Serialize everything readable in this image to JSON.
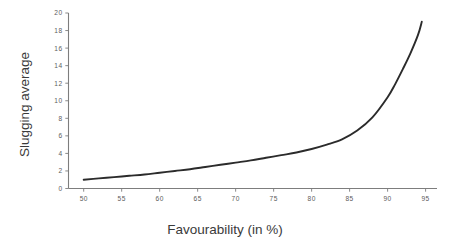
{
  "chart_data": {
    "type": "line",
    "title": "",
    "xlabel": "Favourability (in %)",
    "ylabel": "Slugging average",
    "xlim": [
      48,
      96.5
    ],
    "ylim": [
      0,
      20
    ],
    "grid": false,
    "legend": false,
    "xticks": [
      50,
      55,
      60,
      65,
      70,
      75,
      80,
      85,
      90,
      95
    ],
    "yticks": [
      0,
      2,
      4,
      6,
      8,
      10,
      12,
      14,
      16,
      18,
      20
    ],
    "xtick_labels": [
      "50",
      "55",
      "60",
      "65",
      "70",
      "75",
      "80",
      "85",
      "90",
      "95"
    ],
    "ytick_labels": [
      "0",
      "2",
      "4",
      "6",
      "8",
      "10",
      "12",
      "14",
      "16",
      "18",
      "20"
    ],
    "line_color": "#2b2b2b",
    "series": [
      {
        "name": "Slugging average vs Favourability",
        "x": [
          50,
          52,
          54,
          56,
          58,
          60,
          62,
          64,
          66,
          68,
          70,
          72,
          74,
          76,
          78,
          80,
          82,
          84,
          86,
          88,
          90,
          91,
          92,
          93,
          94,
          94.5
        ],
        "values": [
          1.0,
          1.15,
          1.3,
          1.45,
          1.6,
          1.8,
          2.0,
          2.2,
          2.45,
          2.7,
          2.95,
          3.2,
          3.5,
          3.8,
          4.1,
          4.5,
          5.0,
          5.6,
          6.6,
          8.1,
          10.4,
          11.9,
          13.6,
          15.4,
          17.5,
          19.0
        ]
      }
    ]
  },
  "axes": {
    "x_title": "Favourability (in %)",
    "y_title": "Slugging average"
  }
}
